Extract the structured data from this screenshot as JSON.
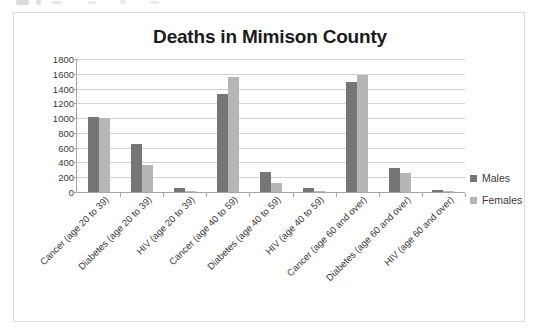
{
  "chart_data": {
    "type": "bar",
    "title": "Deaths in Mimison County",
    "xlabel": "",
    "ylabel": "",
    "ylim": [
      0,
      1800
    ],
    "y_ticks": [
      1800,
      1600,
      1400,
      1200,
      1000,
      800,
      600,
      400,
      200,
      0
    ],
    "grid": true,
    "legend_position": "right",
    "categories": [
      "Cancer (age 20 to 39)",
      "Diabetes (age 20 to 39)",
      "HIV (age 20 to 39)",
      "Cancer (age 40 to 59)",
      "Diabetes (age 40 to 59)",
      "HIV (age 40 to 59)",
      "Cancer (age 60 and over)",
      "Diabetes (age 60 and over)",
      "HIV (age 60 and over)"
    ],
    "series": [
      {
        "name": "Males",
        "color": "#767676",
        "values": [
          1020,
          645,
          50,
          1330,
          275,
          55,
          1490,
          330,
          30
        ]
      },
      {
        "name": "Females",
        "color": "#b6b6b6",
        "values": [
          1000,
          365,
          20,
          1560,
          120,
          20,
          1590,
          260,
          20
        ]
      }
    ]
  },
  "legend": {
    "entries": [
      {
        "label": "Males",
        "color": "#767676"
      },
      {
        "label": "Females",
        "color": "#b6b6b6"
      }
    ]
  }
}
